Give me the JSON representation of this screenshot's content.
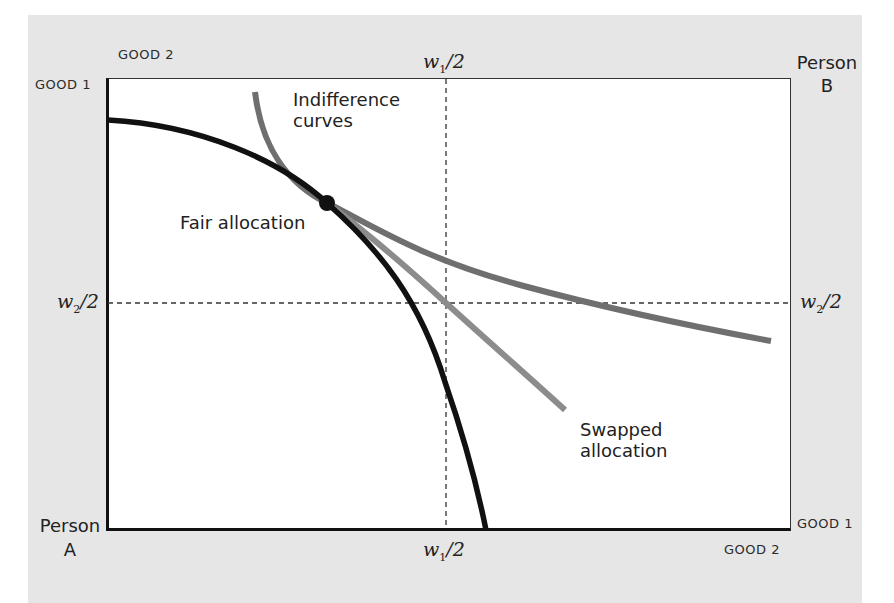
{
  "diagram": {
    "type": "edgeworth-box",
    "corners": {
      "origin_a": {
        "line1": "Person",
        "line2": "A"
      },
      "origin_b": {
        "line1": "Person",
        "line2": "B"
      }
    },
    "axis_labels": {
      "top_left_good2": "GOOD 2",
      "top_left_good1": "GOOD 1",
      "bottom_right_good1": "GOOD 1",
      "bottom_right_good2": "GOOD 2"
    },
    "midpoints": {
      "w1_top": {
        "var": "w",
        "sub": "1",
        "rest": "/2"
      },
      "w1_bottom": {
        "var": "w",
        "sub": "1",
        "rest": "/2"
      },
      "w2_left": {
        "var": "w",
        "sub": "2",
        "rest": "/2"
      },
      "w2_right": {
        "var": "w",
        "sub": "2",
        "rest": "/2"
      }
    },
    "annotations": {
      "indifference_line1": "Indifference",
      "indifference_line2": "curves",
      "fair_allocation": "Fair allocation",
      "swapped_line1": "Swapped",
      "swapped_line2": "allocation"
    },
    "colors": {
      "panel_background": "#e6e6e6",
      "plot_background": "#ffffff",
      "black_curve": "#111111",
      "indifference_curve_dark": "#6f6f6f",
      "indifference_curve_light": "#8c8c8c",
      "dashed_lines": "#333333"
    },
    "elements": [
      {
        "name": "person-a-indifference-curve",
        "color": "#111111",
        "description": "concave black curve from left axis through fair allocation to bottom axis"
      },
      {
        "name": "indifference-curve-1",
        "color": "#6f6f6f",
        "description": "convex gray curve passing through fair allocation, flattening to the right"
      },
      {
        "name": "indifference-curve-2",
        "color": "#8c8c8c",
        "description": "lighter gray curve through fair allocation and center point (swapped allocation)"
      },
      {
        "name": "fair-allocation-point",
        "description": "black dot where curves are tangent"
      },
      {
        "name": "midpoint-dashed-lines",
        "description": "dashed lines at w1/2 (vertical) and w2/2 (horizontal)"
      }
    ]
  }
}
